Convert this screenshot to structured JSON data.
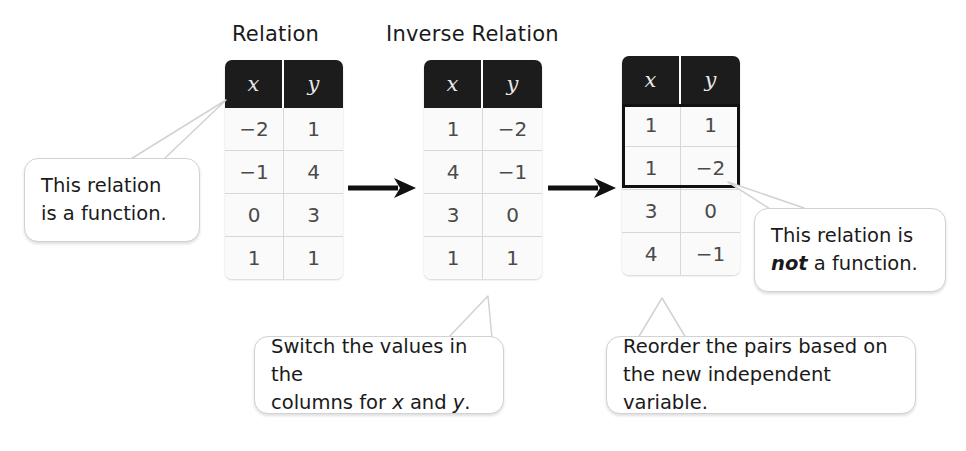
{
  "titles": {
    "relation": "Relation",
    "inverse_relation": "Inverse Relation"
  },
  "tables": [
    {
      "name": "relation-table",
      "headers": [
        "x",
        "y"
      ],
      "rows": [
        [
          "−2",
          "1"
        ],
        [
          "−1",
          "4"
        ],
        [
          "0",
          "3"
        ],
        [
          "1",
          "1"
        ]
      ]
    },
    {
      "name": "inverse-relation-table",
      "headers": [
        "x",
        "y"
      ],
      "rows": [
        [
          "1",
          "−2"
        ],
        [
          "4",
          "−1"
        ],
        [
          "3",
          "0"
        ],
        [
          "1",
          "1"
        ]
      ]
    },
    {
      "name": "reordered-relation-table",
      "headers": [
        "x",
        "y"
      ],
      "rows": [
        [
          "1",
          "1"
        ],
        [
          "1",
          "−2"
        ],
        [
          "3",
          "0"
        ],
        [
          "4",
          "−1"
        ]
      ]
    }
  ],
  "callouts": {
    "left": {
      "line1": "This relation",
      "line2": "is a function."
    },
    "bottom_middle": {
      "line1": "Switch the values in the",
      "line2_pre": "columns for ",
      "line2_x": "x",
      "line2_mid": " and ",
      "line2_y": "y",
      "line2_post": "."
    },
    "bottom_right": {
      "line1": "Reorder the pairs based on",
      "line2": "the new independent variable."
    },
    "right": {
      "line1": "This relation is",
      "line2_not": "not",
      "line2_post": " a function."
    }
  },
  "arrows": [
    {
      "name": "arrow-relation-to-inverse"
    },
    {
      "name": "arrow-inverse-to-reordered"
    }
  ],
  "colors": {
    "header_bg": "#1c1c1c",
    "header_text": "#e8e8e8",
    "cell_text": "#4a4a4a",
    "grid_line": "#d7d7d7",
    "highlight_border": "#111111",
    "callout_border": "#d2d2d2",
    "text": "#1a1a1a",
    "background": "#ffffff"
  }
}
